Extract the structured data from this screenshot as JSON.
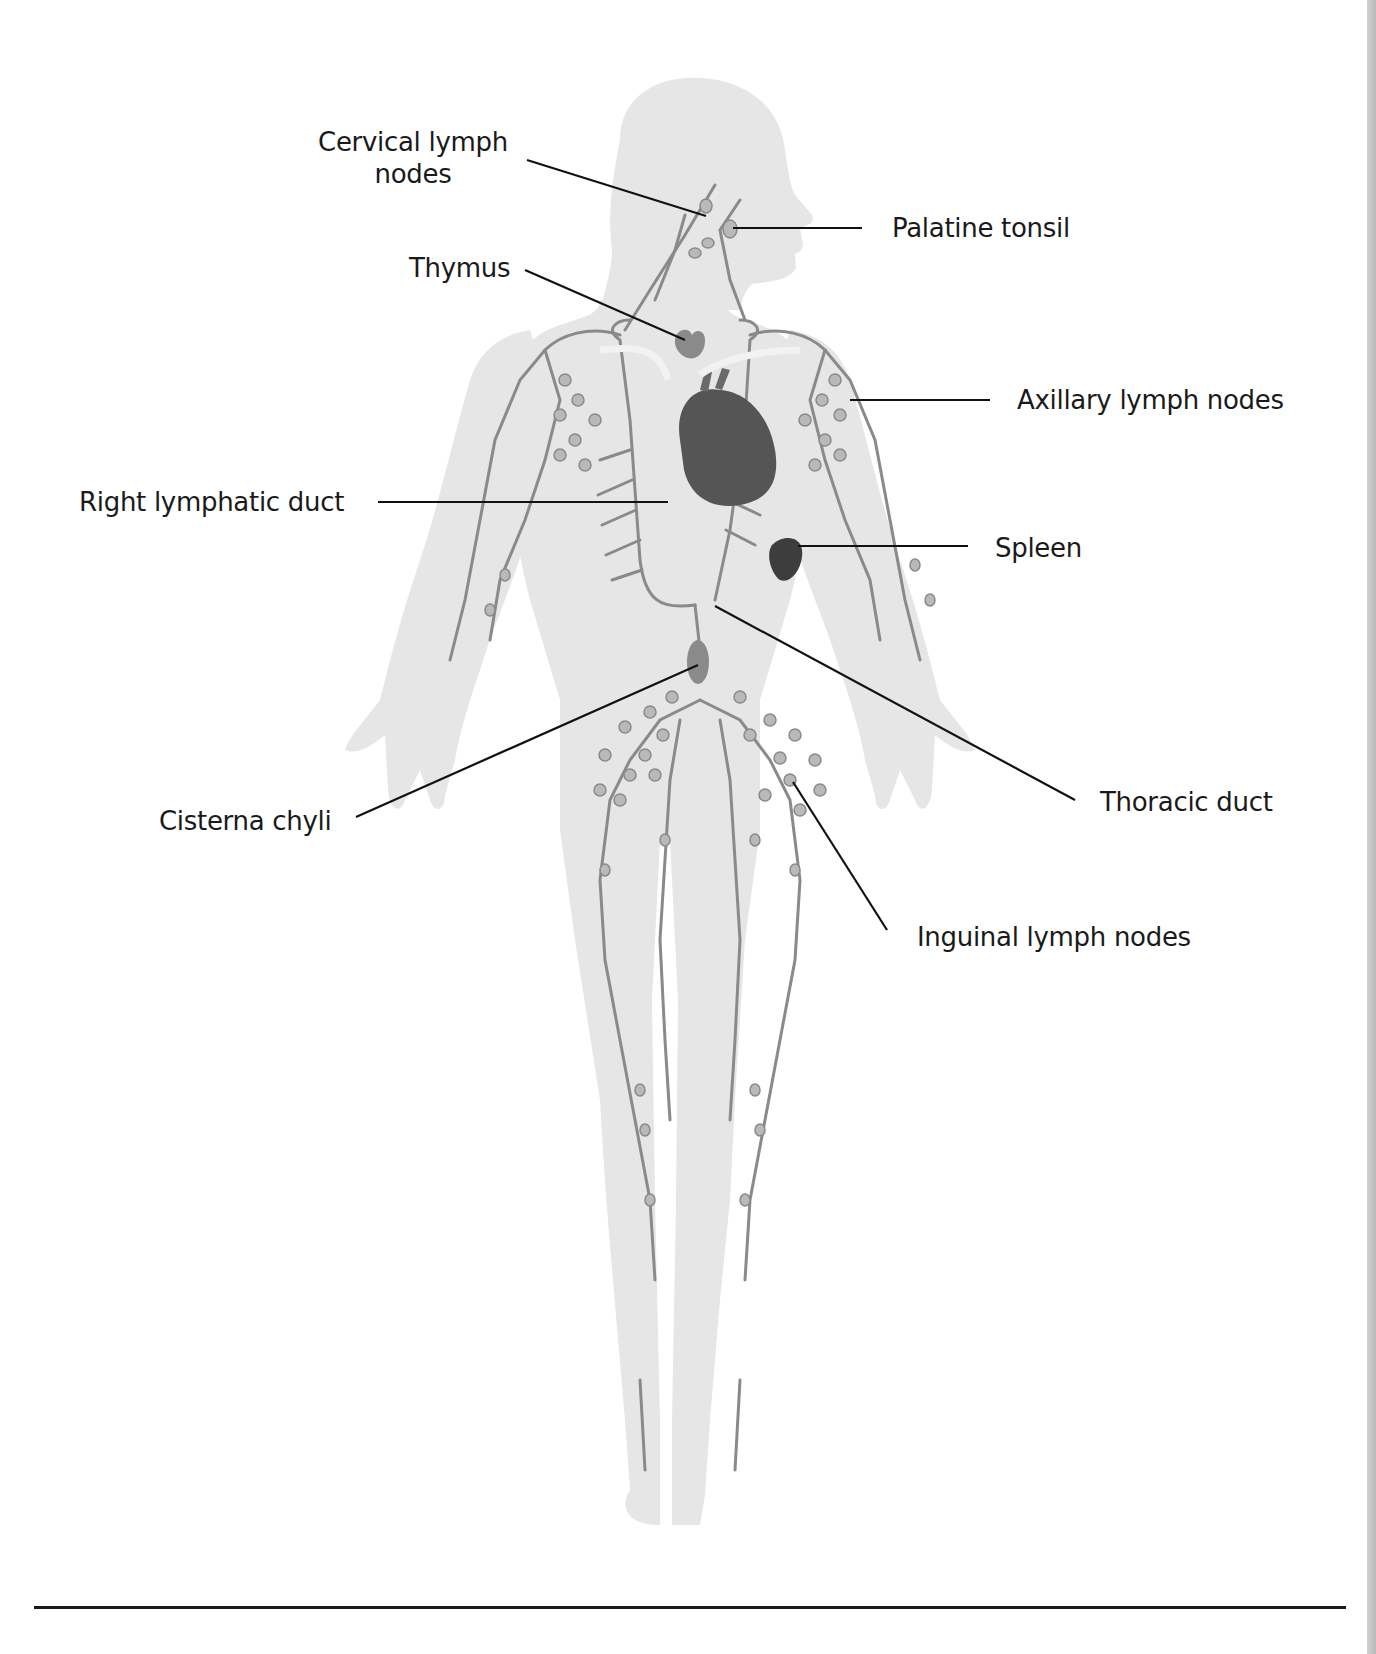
{
  "figure": {
    "colors": {
      "body_silhouette": "#e6e6e6",
      "lymph_vessel": "#8a8a8a",
      "lymph_node": "#b9b9b9",
      "organ_dark": "#4a4a4a",
      "leader_line": "#111111",
      "label_text": "#1a1a1a",
      "edge_strip": "#c4c4c4"
    }
  },
  "labels": {
    "cervical": {
      "line1": "Cervical lymph",
      "line2": "nodes"
    },
    "palatine_tonsil": "Palatine tonsil",
    "thymus": "Thymus",
    "axillary": "Axillary lymph nodes",
    "right_lymphatic_duct": "Right lymphatic duct",
    "spleen": "Spleen",
    "cisterna_chyli": "Cisterna chyli",
    "thoracic_duct": "Thoracic duct",
    "inguinal": "Inguinal lymph nodes"
  }
}
